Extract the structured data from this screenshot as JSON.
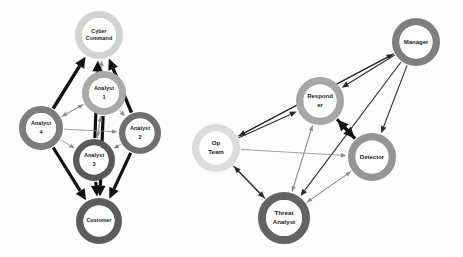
{
  "diagram": {
    "background_color": "#fdfdfd",
    "clusters": [
      {
        "id": "left",
        "name": "analyst-cluster"
      },
      {
        "id": "right",
        "name": "operations-cluster"
      }
    ],
    "nodes": [
      {
        "id": "cyber_command",
        "label_lines": [
          "Cyber",
          "Command"
        ],
        "label": "Cyber Command",
        "cx": 99,
        "cy": 35,
        "r_outer": 24,
        "r_inner": 17,
        "ring_color": "#d2d2d2",
        "core_color": "#ffffff",
        "font_size": 5.4,
        "cluster": "left"
      },
      {
        "id": "analyst_1",
        "label_lines": [
          "Analyst",
          "1"
        ],
        "label": "Analyst 1",
        "cx": 104,
        "cy": 93,
        "r_outer": 22,
        "r_inner": 15,
        "ring_color": "#a9a9a9",
        "core_color": "#ffffff",
        "font_size": 5.6,
        "cluster": "left"
      },
      {
        "id": "analyst_4",
        "label_lines": [
          "Analyst",
          "4"
        ],
        "label": "Analyst 4",
        "cx": 41,
        "cy": 128,
        "r_outer": 22,
        "r_inner": 15,
        "ring_color": "#7d7d7d",
        "core_color": "#ffffff",
        "font_size": 5.6,
        "cluster": "left"
      },
      {
        "id": "analyst_2",
        "label_lines": [
          "Analyst",
          "2"
        ],
        "label": "Analyst 2",
        "cx": 140,
        "cy": 133,
        "r_outer": 21,
        "r_inner": 14.5,
        "ring_color": "#6f6f6f",
        "core_color": "#ffffff",
        "font_size": 5.6,
        "cluster": "left"
      },
      {
        "id": "analyst_3",
        "label_lines": [
          "Analyst",
          "3"
        ],
        "label": "Analyst 3",
        "cx": 94,
        "cy": 160,
        "r_outer": 21,
        "r_inner": 14.5,
        "ring_color": "#5a5a5a",
        "core_color": "#ffffff",
        "font_size": 5.6,
        "cluster": "left"
      },
      {
        "id": "customer",
        "label_lines": [
          "Customer"
        ],
        "label": "Customer",
        "cx": 99,
        "cy": 221,
        "r_outer": 23,
        "r_inner": 15.5,
        "ring_color": "#5d5d5d",
        "core_color": "#ffffff",
        "font_size": 5.4,
        "cluster": "left"
      },
      {
        "id": "manager",
        "label_lines": [
          "Manager"
        ],
        "label": "Manager",
        "cx": 416,
        "cy": 42,
        "r_outer": 24,
        "r_inner": 16.5,
        "ring_color": "#7f7f7f",
        "core_color": "#ffffff",
        "font_size": 6.0,
        "cluster": "right"
      },
      {
        "id": "responder",
        "label_lines": [
          "Respond",
          "er"
        ],
        "label": "Responder",
        "cx": 320,
        "cy": 101,
        "r_outer": 24,
        "r_inner": 16.5,
        "ring_color": "#a6a6a6",
        "core_color": "#ffffff",
        "font_size": 6.0,
        "cluster": "right"
      },
      {
        "id": "op_team",
        "label_lines": [
          "Op",
          "Team"
        ],
        "label": "Op Team",
        "cx": 216,
        "cy": 148,
        "r_outer": 24,
        "r_inner": 16.5,
        "ring_color": "#dcdcdc",
        "core_color": "#ffffff",
        "font_size": 6.2,
        "cluster": "right"
      },
      {
        "id": "detector",
        "label_lines": [
          "Detector"
        ],
        "label": "Detector",
        "cx": 372,
        "cy": 157,
        "r_outer": 24,
        "r_inner": 16.5,
        "ring_color": "#949494",
        "core_color": "#ffffff",
        "font_size": 6.0,
        "cluster": "right"
      },
      {
        "id": "threat_analyst",
        "label_lines": [
          "Threat",
          "Analyst"
        ],
        "label": "Threat Analyst",
        "cx": 284,
        "cy": 218,
        "r_outer": 26,
        "r_inner": 18,
        "ring_color": "#636363",
        "core_color": "#ffffff",
        "font_size": 6.2,
        "cluster": "right"
      }
    ],
    "edges": [
      {
        "from": "analyst_4",
        "to": "cyber_command",
        "weight": "thick",
        "width": 3.4,
        "arrow": "end"
      },
      {
        "from": "analyst_2",
        "to": "cyber_command",
        "weight": "thick",
        "width": 3.4,
        "arrow": "end"
      },
      {
        "from": "analyst_3",
        "to": "cyber_command",
        "weight": "thick",
        "width": 3.2,
        "arrow": "end"
      },
      {
        "from": "analyst_1",
        "to": "cyber_command",
        "weight": "thin",
        "width": 0.8,
        "arrow": "end"
      },
      {
        "from": "analyst_4",
        "to": "customer",
        "weight": "thick",
        "width": 3.2,
        "arrow": "end"
      },
      {
        "from": "analyst_2",
        "to": "customer",
        "weight": "thick",
        "width": 3.2,
        "arrow": "end"
      },
      {
        "from": "analyst_3",
        "to": "customer",
        "weight": "thick",
        "width": 3.2,
        "arrow": "end"
      },
      {
        "from": "analyst_1",
        "to": "customer",
        "weight": "thick",
        "width": 3.2,
        "arrow": "end"
      },
      {
        "from": "analyst_4",
        "to": "analyst_1",
        "weight": "thin",
        "width": 0.8,
        "arrow": "end"
      },
      {
        "from": "analyst_4",
        "to": "analyst_2",
        "weight": "thin",
        "width": 0.8,
        "arrow": "end"
      },
      {
        "from": "analyst_4",
        "to": "analyst_3",
        "weight": "thin",
        "width": 0.8,
        "arrow": "end"
      },
      {
        "from": "analyst_1",
        "to": "analyst_4",
        "weight": "thin",
        "width": 0.8,
        "arrow": "end"
      },
      {
        "from": "analyst_1",
        "to": "analyst_3",
        "weight": "thin",
        "width": 0.8,
        "arrow": "end"
      },
      {
        "from": "analyst_1",
        "to": "analyst_2",
        "weight": "thin",
        "width": 0.8,
        "arrow": "end"
      },
      {
        "from": "analyst_2",
        "to": "analyst_3",
        "weight": "thin",
        "width": 0.8,
        "arrow": "end"
      },
      {
        "from": "analyst_3",
        "to": "analyst_1",
        "weight": "thin",
        "width": 0.8,
        "arrow": "end"
      },
      {
        "from": "manager",
        "to": "op_team",
        "weight": "med",
        "width": 1.1,
        "arrow": "end"
      },
      {
        "from": "op_team",
        "to": "manager",
        "weight": "med",
        "width": 1.1,
        "arrow": "end"
      },
      {
        "from": "manager",
        "to": "responder",
        "weight": "med",
        "width": 1.1,
        "arrow": "end"
      },
      {
        "from": "manager",
        "to": "detector",
        "weight": "med",
        "width": 1.1,
        "arrow": "end"
      },
      {
        "from": "manager",
        "to": "threat_analyst",
        "weight": "med",
        "width": 1.1,
        "arrow": "end"
      },
      {
        "from": "responder",
        "to": "detector",
        "weight": "thick",
        "width": 3.0,
        "arrow": "end"
      },
      {
        "from": "detector",
        "to": "responder",
        "weight": "thick",
        "width": 3.4,
        "arrow": "end"
      },
      {
        "from": "op_team",
        "to": "responder",
        "weight": "med",
        "width": 1.1,
        "arrow": "end"
      },
      {
        "from": "op_team",
        "to": "detector",
        "weight": "thin",
        "width": 0.8,
        "arrow": "end"
      },
      {
        "from": "op_team",
        "to": "threat_analyst",
        "weight": "med",
        "width": 2.2,
        "arrow": "end"
      },
      {
        "from": "threat_analyst",
        "to": "op_team",
        "weight": "med",
        "width": 2.2,
        "arrow": "end"
      },
      {
        "from": "threat_analyst",
        "to": "responder",
        "weight": "thin",
        "width": 0.9,
        "arrow": "end"
      },
      {
        "from": "threat_analyst",
        "to": "detector",
        "weight": "thin",
        "width": 0.9,
        "arrow": "end"
      },
      {
        "from": "responder",
        "to": "threat_analyst",
        "weight": "thin",
        "width": 0.9,
        "arrow": "end"
      },
      {
        "from": "detector",
        "to": "threat_analyst",
        "weight": "thin",
        "width": 0.9,
        "arrow": "end"
      }
    ]
  }
}
